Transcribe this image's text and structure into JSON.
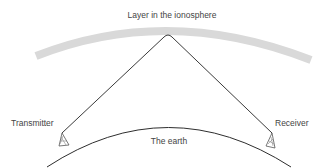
{
  "diagram": {
    "type": "sky-wave radio propagation",
    "labels": {
      "ionosphere": "Layer in the ionosphere",
      "transmitter": "Transmitter",
      "receiver": "Receiver",
      "earth": "The earth"
    },
    "colors": {
      "ionosphere_band": "#d9d9d9",
      "ray": "#3a3a3a",
      "earth_line": "#2e2e2e",
      "text": "#444444",
      "background": "#ffffff"
    },
    "elements": [
      {
        "id": "ionosphere-layer",
        "kind": "curved band"
      },
      {
        "id": "signal-ray",
        "kind": "path",
        "from": "transmitter",
        "via": "ionosphere-layer",
        "to": "receiver"
      },
      {
        "id": "earth-surface",
        "kind": "arc"
      },
      {
        "id": "transmitter-antenna",
        "kind": "tower"
      },
      {
        "id": "receiver-antenna",
        "kind": "tower"
      }
    ]
  }
}
